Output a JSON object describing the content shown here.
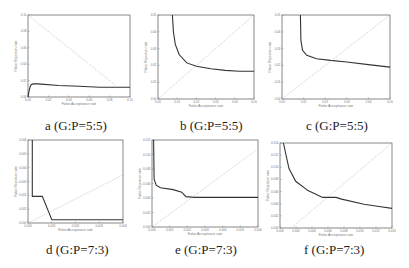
{
  "chart_data": [
    {
      "type": "line",
      "id": "a",
      "caption": "a (G:P=5:5)",
      "xlabel": "False Acceptance rate",
      "ylabel": "False Rejection rate",
      "frame": {
        "x": 28,
        "y": 15,
        "w": 102,
        "h": 82
      },
      "xticks": [
        "0.00",
        "0.02",
        "0.04",
        "0.06",
        "0.08",
        "0.10"
      ],
      "yticks": [
        "0.00",
        "0.02",
        "0.04",
        "0.06",
        "0.08",
        "0.10"
      ],
      "series": [
        {
          "name": "curve",
          "style": "solid",
          "points": [
            [
              0.0,
              1.0
            ],
            [
              0.01,
              0.93
            ],
            [
              0.02,
              0.88
            ],
            [
              0.03,
              0.85
            ],
            [
              0.05,
              0.84
            ],
            [
              0.1,
              0.84
            ],
            [
              0.3,
              0.86
            ],
            [
              0.5,
              0.87
            ],
            [
              0.7,
              0.88
            ],
            [
              1.0,
              0.88
            ]
          ],
          "normalized": true
        },
        {
          "name": "EER line",
          "style": "dotted",
          "points": [
            [
              0,
              0
            ],
            [
              0.85,
              0.85
            ]
          ],
          "normalized": true
        }
      ]
    },
    {
      "type": "line",
      "id": "b",
      "caption": "b (G:P=5:5)",
      "xlabel": "False Acceptance rate",
      "ylabel": "False Rejection rate",
      "frame": {
        "x": 158,
        "y": 15,
        "w": 96,
        "h": 84
      },
      "xticks": [
        "0.00",
        "0.01",
        "0.02",
        "0.03",
        "0.04",
        "0.05"
      ],
      "yticks": [
        "0.00",
        "0.01",
        "0.02",
        "0.03",
        "0.04",
        "0.05"
      ],
      "series": [
        {
          "name": "curve",
          "style": "solid",
          "points": [
            [
              0.15,
              0.0
            ],
            [
              0.16,
              0.2
            ],
            [
              0.18,
              0.35
            ],
            [
              0.22,
              0.47
            ],
            [
              0.3,
              0.57
            ],
            [
              0.4,
              0.61
            ],
            [
              0.55,
              0.64
            ],
            [
              0.7,
              0.66
            ],
            [
              0.85,
              0.67
            ],
            [
              1.0,
              0.67
            ]
          ],
          "normalized": true
        },
        {
          "name": "EER line",
          "style": "dotted",
          "points": [
            [
              0,
              1
            ],
            [
              1,
              0
            ]
          ],
          "normalized": true,
          "diag": "up"
        }
      ]
    },
    {
      "type": "line",
      "id": "c",
      "caption": "c (G:P=5:5)",
      "xlabel": "False Acceptance rate",
      "ylabel": "False Rejection rate",
      "frame": {
        "x": 282,
        "y": 15,
        "w": 108,
        "h": 84
      },
      "xticks": [
        "0.00",
        "0.01",
        "0.02",
        "0.03",
        "0.04",
        "0.05"
      ],
      "yticks": [
        "0.00",
        "0.01",
        "0.02",
        "0.03",
        "0.04",
        "0.05"
      ],
      "series": [
        {
          "name": "curve",
          "style": "solid",
          "points": [
            [
              0.17,
              0.0
            ],
            [
              0.175,
              0.3
            ],
            [
              0.19,
              0.42
            ],
            [
              0.23,
              0.48
            ],
            [
              0.32,
              0.52
            ],
            [
              0.45,
              0.54
            ],
            [
              0.6,
              0.56
            ],
            [
              0.8,
              0.59
            ],
            [
              1.0,
              0.62
            ]
          ],
          "normalized": true
        },
        {
          "name": "EER line",
          "style": "dotted",
          "points": [
            [
              0,
              1
            ],
            [
              1,
              0
            ]
          ],
          "normalized": true
        }
      ]
    },
    {
      "type": "line",
      "id": "d",
      "caption": "d (G:P=7:3)",
      "xlabel": "False Acceptance rate",
      "ylabel": "False Rejection rate",
      "frame": {
        "x": 28,
        "y": 140,
        "w": 95,
        "h": 83
      },
      "xticks": [
        "0.000",
        "0.001",
        "0.002",
        "0.003",
        "0.004"
      ],
      "yticks": [
        "0.000",
        "0.001",
        "0.002",
        "0.003",
        "0.004",
        "0.005",
        "0.006"
      ],
      "series": [
        {
          "name": "curve",
          "style": "solid",
          "points": [
            [
              0.045,
              0.0
            ],
            [
              0.045,
              0.68
            ],
            [
              0.15,
              0.68
            ],
            [
              0.25,
              0.96
            ],
            [
              0.6,
              0.96
            ],
            [
              1.0,
              0.96
            ]
          ],
          "normalized": true
        },
        {
          "name": "EER line",
          "style": "dotted",
          "points": [
            [
              0,
              1
            ],
            [
              1,
              0.42
            ]
          ],
          "normalized": true
        }
      ]
    },
    {
      "type": "line",
      "id": "e",
      "caption": "e (G:P=7:3)",
      "xlabel": "False Acceptance rate",
      "ylabel": "False Rejection rate",
      "frame": {
        "x": 152,
        "y": 140,
        "w": 106,
        "h": 87
      },
      "xticks": [
        "0.000",
        "0.001",
        "0.002",
        "0.003",
        "0.004",
        "0.005",
        "0.006"
      ],
      "yticks": [
        "0.000",
        "0.002",
        "0.004",
        "0.006",
        "0.008",
        "0.010",
        "0.012"
      ],
      "series": [
        {
          "name": "curve",
          "style": "solid",
          "points": [
            [
              0.015,
              0.0
            ],
            [
              0.02,
              0.45
            ],
            [
              0.04,
              0.52
            ],
            [
              0.08,
              0.55
            ],
            [
              0.2,
              0.57
            ],
            [
              0.28,
              0.6
            ],
            [
              0.32,
              0.65
            ],
            [
              0.4,
              0.66
            ],
            [
              0.7,
              0.66
            ],
            [
              1.0,
              0.66
            ]
          ],
          "normalized": true
        },
        {
          "name": "EER line",
          "style": "dotted",
          "points": [
            [
              0,
              1
            ],
            [
              1,
              0.1
            ]
          ],
          "normalized": true
        }
      ]
    },
    {
      "type": "line",
      "id": "f",
      "caption": "f (G:P=7:3)",
      "xlabel": "False Acceptance rate",
      "ylabel": "False Rejection rate",
      "frame": {
        "x": 280,
        "y": 143,
        "w": 112,
        "h": 85
      },
      "xticks": [
        "0.000",
        "0.002",
        "0.004",
        "0.006",
        "0.008",
        "0.010",
        "0.012",
        "0.014"
      ],
      "yticks": [
        "0.000",
        "0.002",
        "0.004",
        "0.006",
        "0.008",
        "0.010",
        "0.012",
        "0.014"
      ],
      "series": [
        {
          "name": "curve",
          "style": "solid",
          "points": [
            [
              0.03,
              0.0
            ],
            [
              0.08,
              0.3
            ],
            [
              0.14,
              0.45
            ],
            [
              0.25,
              0.56
            ],
            [
              0.38,
              0.64
            ],
            [
              0.5,
              0.64
            ],
            [
              0.55,
              0.66
            ],
            [
              0.75,
              0.72
            ],
            [
              0.9,
              0.75
            ],
            [
              1.0,
              0.77
            ]
          ],
          "normalized": true
        },
        {
          "name": "EER line",
          "style": "dotted",
          "points": [
            [
              0.1,
              1
            ],
            [
              1,
              0
            ]
          ],
          "normalized": true
        }
      ]
    }
  ]
}
